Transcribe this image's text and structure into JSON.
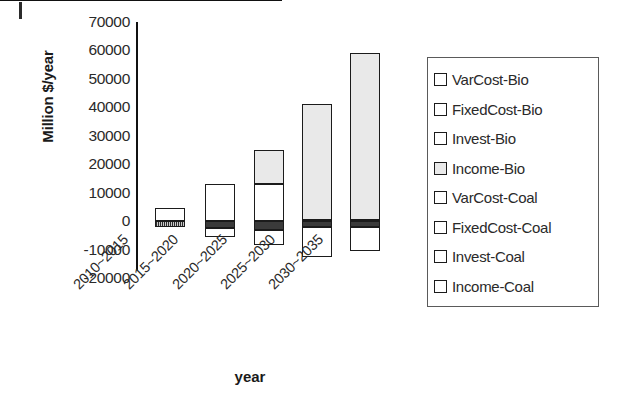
{
  "chart_data": {
    "type": "bar",
    "subtype": "stacked-bar-with-negative",
    "title": "",
    "xlabel": "year",
    "ylabel": "Million $/year",
    "ylim": [
      -20000,
      70000
    ],
    "ytick_step": 10000,
    "ytick_labels": [
      "70000",
      "60000",
      "50000",
      "40000",
      "30000",
      "20000",
      "10000",
      "0",
      "-10000",
      "-20000"
    ],
    "yticks": [
      70000,
      60000,
      50000,
      40000,
      30000,
      20000,
      10000,
      0,
      -10000,
      -20000
    ],
    "grid": false,
    "legend_position": "right",
    "categories": [
      "2010~2015",
      "2015~2020",
      "2020~2025",
      "2025~2030",
      "2030~2035"
    ],
    "series": [
      {
        "name": "VarCost-Bio",
        "fill": "white",
        "values": [
          0,
          0,
          0,
          0,
          0
        ]
      },
      {
        "name": "FixedCost-Bio",
        "fill": "white",
        "values": [
          0,
          0,
          0,
          0,
          0
        ]
      },
      {
        "name": "Invest-Bio",
        "fill": "white",
        "values": [
          0,
          0,
          0,
          0,
          0
        ]
      },
      {
        "name": "Income-Bio",
        "fill": "light-gray",
        "values": [
          0,
          0,
          12000,
          40500,
          58500
        ]
      },
      {
        "name": "VarCost-Coal",
        "fill": "white",
        "values": [
          4500,
          13000,
          13000,
          500,
          500
        ]
      },
      {
        "name": "FixedCost-Coal",
        "fill": "white",
        "values": [
          0,
          0,
          0,
          0,
          0
        ]
      },
      {
        "name": "Invest-Coal",
        "fill": "dark",
        "values": [
          -2000,
          -2500,
          -3000,
          -2000,
          -2000
        ]
      },
      {
        "name": "Income-Coal",
        "fill": "white",
        "values": [
          0,
          -3000,
          -5500,
          -10500,
          -8500
        ]
      }
    ],
    "bars": [
      {
        "category": "2010~2015",
        "total_positive": 4500,
        "total_negative": -2000,
        "segments": [
          {
            "series": "VarCost-Coal",
            "from": 0,
            "to": 4500,
            "fill": "white"
          },
          {
            "series": "Invest-Coal",
            "from": -2000,
            "to": 0,
            "fill": "hatch"
          }
        ]
      },
      {
        "category": "2015~2020",
        "total_positive": 13000,
        "total_negative": -5500,
        "segments": [
          {
            "series": "VarCost-Coal",
            "from": 0,
            "to": 13000,
            "fill": "white"
          },
          {
            "series": "Invest-Coal",
            "from": -2500,
            "to": 0,
            "fill": "dark"
          },
          {
            "series": "Income-Coal",
            "from": -5500,
            "to": -2500,
            "fill": "white"
          }
        ]
      },
      {
        "category": "2020~2025",
        "total_positive": 25000,
        "total_negative": -8500,
        "segments": [
          {
            "series": "Income-Bio",
            "from": 13000,
            "to": 25000,
            "fill": "light-gray"
          },
          {
            "series": "VarCost-Coal",
            "from": 0,
            "to": 13000,
            "fill": "white"
          },
          {
            "series": "Invest-Coal",
            "from": -3000,
            "to": 0,
            "fill": "dark"
          },
          {
            "series": "Income-Coal",
            "from": -8500,
            "to": -3000,
            "fill": "white"
          }
        ]
      },
      {
        "category": "2025~2030",
        "total_positive": 41000,
        "total_negative": -12500,
        "segments": [
          {
            "series": "Income-Bio",
            "from": 500,
            "to": 41000,
            "fill": "light-gray"
          },
          {
            "series": "VarCost-Coal",
            "from": 0,
            "to": 500,
            "fill": "white"
          },
          {
            "series": "Invest-Coal",
            "from": -2000,
            "to": 0,
            "fill": "dark"
          },
          {
            "series": "Income-Coal",
            "from": -12500,
            "to": -2000,
            "fill": "white"
          }
        ]
      },
      {
        "category": "2030~2035",
        "total_positive": 59000,
        "total_negative": -10500,
        "segments": [
          {
            "series": "Income-Bio",
            "from": 500,
            "to": 59000,
            "fill": "light-gray"
          },
          {
            "series": "VarCost-Coal",
            "from": 0,
            "to": 500,
            "fill": "white"
          },
          {
            "series": "Invest-Coal",
            "from": -2000,
            "to": 0,
            "fill": "dark"
          },
          {
            "series": "Income-Coal",
            "from": -10500,
            "to": -2000,
            "fill": "white"
          }
        ]
      }
    ],
    "legend": [
      {
        "label": "VarCost-Bio",
        "fill": "white"
      },
      {
        "label": "FixedCost-Bio",
        "fill": "white"
      },
      {
        "label": "Invest-Bio",
        "fill": "white"
      },
      {
        "label": "Income-Bio",
        "fill": "light-gray"
      },
      {
        "label": "VarCost-Coal",
        "fill": "white"
      },
      {
        "label": "FixedCost-Coal",
        "fill": "white"
      },
      {
        "label": "Invest-Coal",
        "fill": "white"
      },
      {
        "label": "Income-Coal",
        "fill": "white"
      }
    ],
    "colors": {
      "axis": "#111111",
      "outline": "#1b1b1b",
      "white_fill": "#ffffff",
      "light_gray_fill": "#e9e9e9",
      "dark_fill": "#3a3a3a",
      "legend_border": "#5a5a5a",
      "text": "#2a2a2a"
    }
  }
}
